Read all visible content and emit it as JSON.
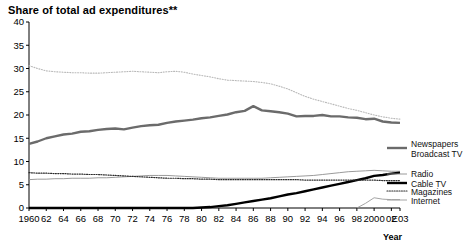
{
  "chart_data": {
    "type": "line",
    "title": "Share of total ad expenditures**",
    "xlabel": "Year",
    "ylabel": "",
    "xlim": [
      1960,
      2003
    ],
    "ylim": [
      0,
      40
    ],
    "grid": false,
    "legend_position": "right",
    "x": [
      1960,
      1961,
      1962,
      1963,
      1964,
      1965,
      1966,
      1967,
      1968,
      1969,
      1970,
      1971,
      1972,
      1973,
      1974,
      1975,
      1976,
      1977,
      1978,
      1979,
      1980,
      1981,
      1982,
      1983,
      1984,
      1985,
      1986,
      1987,
      1988,
      1989,
      1990,
      1991,
      1992,
      1993,
      1994,
      1995,
      1996,
      1997,
      1998,
      1999,
      2000,
      2001,
      2002,
      2003
    ],
    "tick_labels_x": [
      "1960",
      "62",
      "64",
      "66",
      "68",
      "70",
      "72",
      "74",
      "76",
      "78",
      "80",
      "82",
      "84",
      "86",
      "88",
      "90",
      "92",
      "94",
      "96",
      "98",
      "2000",
      "02",
      "E03"
    ],
    "tick_labels_y": [
      "0",
      "5",
      "10",
      "15",
      "20",
      "25",
      "30",
      "35",
      "40"
    ],
    "series": [
      {
        "name": "Newspapers",
        "style": "dotted-light",
        "color": "#b9b9b9",
        "values": [
          30.6,
          30.0,
          29.5,
          29.3,
          29.2,
          29.1,
          29.1,
          29.0,
          29.0,
          29.1,
          29.2,
          29.3,
          29.4,
          29.3,
          29.2,
          29.1,
          29.3,
          29.4,
          29.2,
          28.8,
          28.5,
          28.2,
          27.8,
          27.5,
          27.4,
          27.3,
          27.2,
          27.0,
          26.7,
          26.2,
          25.6,
          24.8,
          24.0,
          23.4,
          22.9,
          22.4,
          21.9,
          21.4,
          21.0,
          20.5,
          20.0,
          19.6,
          19.3,
          19.1
        ]
      },
      {
        "name": "Broadcast TV",
        "style": "thick-gray",
        "color": "#6b6b6b",
        "values": [
          13.8,
          14.3,
          15.0,
          15.4,
          15.8,
          16.0,
          16.4,
          16.5,
          16.8,
          17.0,
          17.1,
          16.9,
          17.3,
          17.6,
          17.8,
          17.9,
          18.3,
          18.6,
          18.8,
          19.0,
          19.3,
          19.5,
          19.8,
          20.1,
          20.6,
          20.9,
          21.9,
          21.0,
          20.8,
          20.6,
          20.3,
          19.7,
          19.8,
          19.8,
          20.0,
          19.7,
          19.7,
          19.5,
          19.4,
          19.1,
          19.2,
          18.6,
          18.4,
          18.3
        ]
      },
      {
        "name": "Radio",
        "style": "thin-gray",
        "color": "#8f8f8f",
        "values": [
          6.1,
          6.2,
          6.2,
          6.3,
          6.3,
          6.4,
          6.4,
          6.4,
          6.5,
          6.5,
          6.6,
          6.7,
          6.8,
          6.9,
          7.0,
          7.0,
          7.0,
          6.9,
          6.8,
          6.7,
          6.6,
          6.5,
          6.4,
          6.4,
          6.4,
          6.4,
          6.4,
          6.4,
          6.5,
          6.6,
          6.7,
          6.8,
          6.9,
          7.0,
          7.2,
          7.4,
          7.6,
          7.8,
          7.9,
          8.0,
          8.1,
          8.0,
          7.9,
          7.9
        ]
      },
      {
        "name": "Cable TV",
        "style": "thick-black",
        "color": "#000000",
        "values": [
          0,
          0,
          0,
          0,
          0,
          0,
          0,
          0,
          0,
          0,
          0,
          0,
          0,
          0,
          0,
          0,
          0,
          0,
          0,
          0,
          0.1,
          0.2,
          0.4,
          0.6,
          0.9,
          1.2,
          1.5,
          1.8,
          2.1,
          2.5,
          2.9,
          3.2,
          3.6,
          4.0,
          4.4,
          4.8,
          5.2,
          5.6,
          6.0,
          6.4,
          6.9,
          7.1,
          7.4,
          7.6
        ]
      },
      {
        "name": "Magazines",
        "style": "dotted-dark",
        "color": "#2b2b2b",
        "values": [
          7.6,
          7.5,
          7.5,
          7.4,
          7.4,
          7.3,
          7.3,
          7.2,
          7.2,
          7.1,
          7.0,
          6.9,
          6.8,
          6.7,
          6.6,
          6.5,
          6.4,
          6.4,
          6.3,
          6.3,
          6.2,
          6.2,
          6.1,
          6.1,
          6.1,
          6.1,
          6.1,
          6.1,
          6.1,
          6.1,
          6.1,
          6.1,
          6.0,
          6.0,
          6.0,
          6.0,
          6.0,
          6.0,
          6.0,
          6.0,
          6.0,
          5.9,
          5.9,
          5.9
        ]
      },
      {
        "name": "Internet",
        "style": "thin-gray",
        "color": "#9a9a9a",
        "values": [
          null,
          null,
          null,
          null,
          null,
          null,
          null,
          null,
          null,
          null,
          null,
          null,
          null,
          null,
          null,
          null,
          null,
          null,
          null,
          null,
          null,
          null,
          null,
          null,
          null,
          null,
          null,
          null,
          null,
          null,
          null,
          null,
          null,
          null,
          null,
          null,
          null,
          null,
          0.0,
          1.0,
          2.2,
          1.9,
          1.8,
          1.8
        ]
      }
    ],
    "legend_entries": [
      {
        "label": "Newspapers",
        "style": "dotted-light"
      },
      {
        "label": "Broadcast TV",
        "style": "thick-gray"
      },
      {
        "label": "Radio",
        "style": "thin-gray"
      },
      {
        "label": "Cable TV",
        "style": "thick-black"
      },
      {
        "label": "Magazines",
        "style": "dotted-dark"
      },
      {
        "label": "Internet",
        "style": "thin-gray"
      }
    ]
  }
}
